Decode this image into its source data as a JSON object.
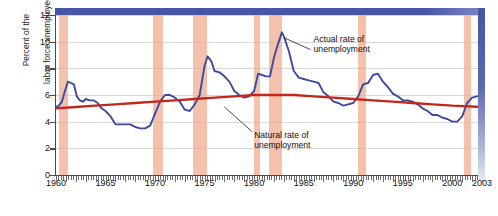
{
  "chart_data": {
    "type": "line",
    "title": "",
    "xlabel": "",
    "ylabel": "Percent of the labor force unemployed",
    "ylabel_line1": "Percent of the",
    "ylabel_line2": "labor force unemployed",
    "xlim": [
      1960,
      2003
    ],
    "ylim": [
      0,
      12
    ],
    "yticks": [
      0,
      2,
      4,
      6,
      8,
      10,
      12
    ],
    "xticks": [
      1960,
      1965,
      1970,
      1975,
      1980,
      1985,
      1990,
      1995,
      2000,
      2003
    ],
    "grid": "horizontal",
    "legend": "none",
    "annotations": [
      {
        "name": "actual-rate-annotation",
        "line1": "Actual rate of",
        "line2": "unemployment",
        "x": 1986.0,
        "y": 10.6
      },
      {
        "name": "natural-rate-annotation",
        "line1": "Natural rate of",
        "line2": "unemployment",
        "x": 1980.0,
        "y": 3.4
      }
    ],
    "recession_bands": [
      {
        "start": 1960.3,
        "end": 1961.2
      },
      {
        "start": 1969.8,
        "end": 1970.8
      },
      {
        "start": 1973.8,
        "end": 1975.2
      },
      {
        "start": 1980.0,
        "end": 1980.6
      },
      {
        "start": 1981.5,
        "end": 1982.8
      },
      {
        "start": 1990.5,
        "end": 1991.3
      },
      {
        "start": 2001.2,
        "end": 2001.9
      }
    ],
    "series": [
      {
        "name": "Actual rate of unemployment",
        "color": "#3d4a9e",
        "x": [
          1960.0,
          1960.3,
          1960.6,
          1960.9,
          1961.2,
          1961.5,
          1961.8,
          1962.1,
          1962.4,
          1962.7,
          1963.0,
          1963.4,
          1963.8,
          1964.2,
          1964.6,
          1965.0,
          1965.5,
          1966.0,
          1966.5,
          1967.0,
          1967.5,
          1968.0,
          1968.5,
          1969.0,
          1969.5,
          1970.0,
          1970.5,
          1971.0,
          1971.5,
          1972.0,
          1972.5,
          1973.0,
          1973.5,
          1974.0,
          1974.5,
          1975.0,
          1975.3,
          1975.7,
          1976.0,
          1976.5,
          1977.0,
          1977.5,
          1978.0,
          1978.5,
          1979.0,
          1979.5,
          1980.0,
          1980.4,
          1980.8,
          1981.2,
          1981.6,
          1982.0,
          1982.4,
          1982.8,
          1983.0,
          1983.5,
          1984.0,
          1984.5,
          1985.0,
          1985.5,
          1986.0,
          1986.5,
          1987.0,
          1987.5,
          1988.0,
          1988.5,
          1989.0,
          1989.5,
          1990.0,
          1990.5,
          1991.0,
          1991.5,
          1992.0,
          1992.5,
          1993.0,
          1993.5,
          1994.0,
          1994.5,
          1995.0,
          1995.5,
          1996.0,
          1996.5,
          1997.0,
          1997.5,
          1998.0,
          1998.5,
          1999.0,
          1999.5,
          2000.0,
          2000.5,
          2001.0,
          2001.5,
          2002.0,
          2002.5,
          2003.0
        ],
        "y": [
          5.1,
          5.2,
          5.5,
          6.3,
          7.0,
          6.9,
          6.8,
          5.9,
          5.6,
          5.5,
          5.7,
          5.6,
          5.6,
          5.4,
          5.0,
          4.8,
          4.4,
          3.8,
          3.8,
          3.8,
          3.8,
          3.6,
          3.5,
          3.5,
          3.7,
          4.6,
          5.5,
          6.0,
          6.0,
          5.8,
          5.5,
          4.9,
          4.8,
          5.3,
          6.0,
          8.2,
          8.9,
          8.5,
          7.8,
          7.7,
          7.4,
          7.0,
          6.3,
          6.0,
          5.8,
          5.9,
          6.3,
          7.6,
          7.5,
          7.4,
          7.4,
          8.8,
          9.8,
          10.7,
          10.4,
          9.3,
          7.8,
          7.3,
          7.2,
          7.1,
          7.0,
          6.9,
          6.2,
          5.9,
          5.5,
          5.4,
          5.2,
          5.3,
          5.4,
          5.9,
          6.8,
          6.9,
          7.5,
          7.6,
          7.0,
          6.6,
          6.1,
          5.9,
          5.6,
          5.6,
          5.5,
          5.3,
          5.0,
          4.8,
          4.5,
          4.5,
          4.3,
          4.2,
          4.0,
          4.0,
          4.4,
          5.4,
          5.8,
          5.9,
          6.0
        ]
      },
      {
        "name": "Natural rate of unemployment",
        "color": "#c1271d",
        "x": [
          1960,
          1962,
          1964,
          1966,
          1968,
          1970,
          1972,
          1974,
          1976,
          1978,
          1980,
          1982,
          1984,
          1986,
          1988,
          1990,
          1992,
          1994,
          1996,
          1998,
          2000,
          2003
        ],
        "y": [
          5.0,
          5.1,
          5.2,
          5.3,
          5.4,
          5.5,
          5.6,
          5.7,
          5.8,
          5.9,
          6.0,
          6.0,
          6.0,
          5.9,
          5.8,
          5.7,
          5.6,
          5.5,
          5.4,
          5.3,
          5.2,
          5.1
        ]
      }
    ]
  }
}
